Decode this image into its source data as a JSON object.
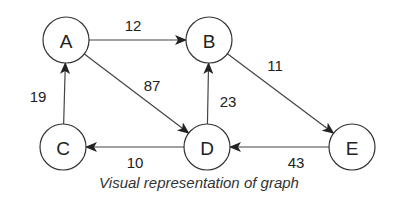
{
  "figure": {
    "caption": "Visual representation of graph",
    "colors": {
      "stroke": "#333333",
      "text": "#222222",
      "background": "#ffffff"
    }
  },
  "graph": {
    "directed": true,
    "nodes": [
      {
        "id": "A",
        "label": "A",
        "x": 66,
        "y": 40
      },
      {
        "id": "B",
        "label": "B",
        "x": 209,
        "y": 40
      },
      {
        "id": "C",
        "label": "C",
        "x": 63,
        "y": 147
      },
      {
        "id": "D",
        "label": "D",
        "x": 207,
        "y": 147
      },
      {
        "id": "E",
        "label": "E",
        "x": 352,
        "y": 147
      }
    ],
    "edges": [
      {
        "from": "A",
        "to": "B",
        "weight": "12",
        "label_x": 133,
        "label_y": 25
      },
      {
        "from": "A",
        "to": "D",
        "weight": "87",
        "label_x": 152,
        "label_y": 85
      },
      {
        "from": "C",
        "to": "A",
        "weight": "19",
        "label_x": 38,
        "label_y": 96
      },
      {
        "from": "D",
        "to": "B",
        "weight": "23",
        "label_x": 228,
        "label_y": 101
      },
      {
        "from": "B",
        "to": "E",
        "weight": "11",
        "label_x": 275,
        "label_y": 65
      },
      {
        "from": "D",
        "to": "C",
        "weight": "10",
        "label_x": 135,
        "label_y": 162
      },
      {
        "from": "E",
        "to": "D",
        "weight": "43",
        "label_x": 296,
        "label_y": 162
      }
    ]
  }
}
